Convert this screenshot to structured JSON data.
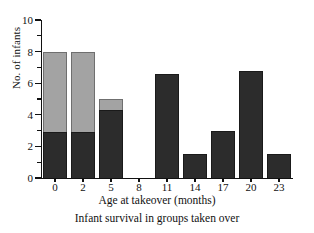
{
  "chart_data": {
    "type": "bar",
    "title": "",
    "subtitle": "Infant survival in groups taken over",
    "xlabel": "Age at takeover (months)",
    "ylabel": "No. of infants",
    "categories": [
      "0",
      "2",
      "5",
      "8",
      "11",
      "14",
      "17",
      "20",
      "23"
    ],
    "stacked": true,
    "series": [
      {
        "name": "survived",
        "color": "#2c2c2c",
        "values": [
          2.9,
          2.9,
          4.3,
          0,
          6.6,
          1.5,
          3.0,
          6.8,
          1.5
        ]
      },
      {
        "name": "died",
        "color": "#a3a3a3",
        "values": [
          5.1,
          5.1,
          0.7,
          0,
          0,
          0,
          0,
          0,
          0
        ]
      }
    ],
    "totals": [
      8,
      8,
      5,
      0,
      6.6,
      1.5,
      3.0,
      6.8,
      1.5
    ],
    "ylim": [
      0,
      10
    ],
    "y_major_ticks": [
      0,
      2,
      4,
      6,
      8,
      10
    ],
    "y_minor_ticks": [
      1,
      3,
      5,
      7,
      9
    ],
    "y_tick_labels": [
      "0",
      "2",
      "4",
      "6",
      "8",
      "10"
    ],
    "grid": false,
    "legend": "none"
  },
  "axis": {
    "y_title": "No. of infants",
    "x_title": "Age at takeover (months)"
  },
  "caption": {
    "text": "Infant survival in groups taken over"
  }
}
